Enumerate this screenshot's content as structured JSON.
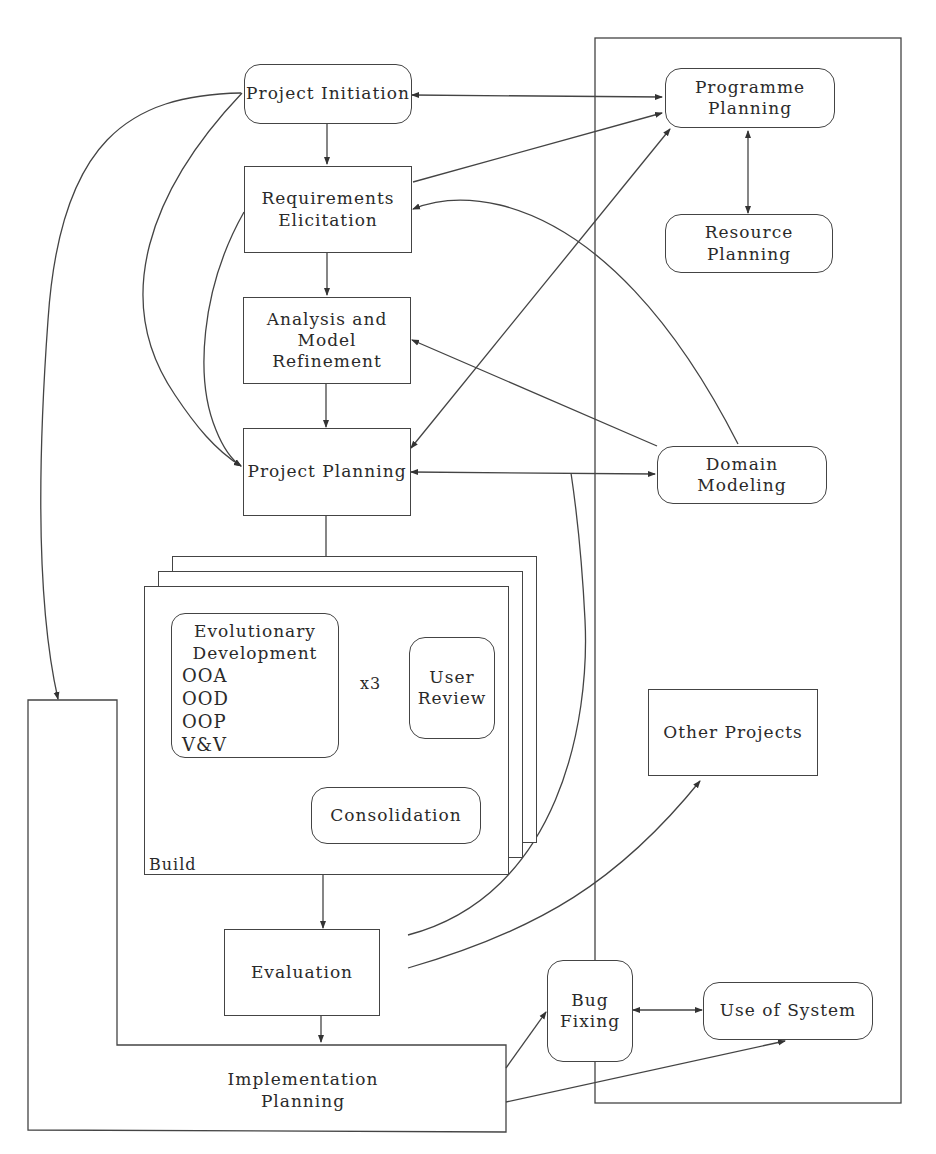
{
  "diagram": {
    "type": "process-flow",
    "nodes": {
      "project_initiation": {
        "line1": "Project Initiation",
        "shape": "rounded"
      },
      "programme_planning": {
        "line1": "Programme",
        "line2": "Planning",
        "shape": "rounded"
      },
      "requirements_elicitation": {
        "line1": "Requirements",
        "line2": "Elicitation",
        "shape": "rect"
      },
      "resource_planning": {
        "line1": "Resource",
        "line2": "Planning",
        "shape": "rounded"
      },
      "analysis_model_refinement": {
        "line1": "Analysis and",
        "line2": "Model Refinement",
        "shape": "rect"
      },
      "project_planning": {
        "line1": "Project Planning",
        "shape": "rect"
      },
      "domain_modeling": {
        "line1": "Domain",
        "line2": "Modeling",
        "shape": "rounded"
      },
      "evolutionary_development": {
        "line1": "Evolutionary",
        "line2": "Development",
        "items": [
          "OOA",
          "OOD",
          "OOP",
          "V&V"
        ],
        "shape": "rounded"
      },
      "iteration_label": "x3",
      "user_review": {
        "line1": "User",
        "line2": "Review",
        "shape": "rounded"
      },
      "consolidation": {
        "line1": "Consolidation",
        "shape": "rounded"
      },
      "build_group": {
        "label": "Build",
        "stack_count": 3
      },
      "other_projects": {
        "line1": "Other Projects",
        "shape": "rect"
      },
      "evaluation": {
        "line1": "Evaluation",
        "shape": "rect"
      },
      "bug_fixing": {
        "line1": "Bug",
        "line2": "Fixing",
        "shape": "rounded"
      },
      "use_of_system": {
        "line1": "Use of System",
        "shape": "rounded"
      },
      "implementation_planning": {
        "line1": "Implementation",
        "line2": "Planning",
        "shape": "L-shaped"
      }
    },
    "edges": [
      {
        "from": "Project Initiation",
        "to": "Programme Planning",
        "bidirectional": true
      },
      {
        "from": "Project Initiation",
        "to": "Requirements Elicitation"
      },
      {
        "from": "Project Initiation",
        "to": "Project Planning",
        "curved": true
      },
      {
        "from": "Project Initiation",
        "to": "Implementation Planning",
        "curved": true
      },
      {
        "from": "Requirements Elicitation",
        "to": "Programme Planning"
      },
      {
        "from": "Requirements Elicitation",
        "to": "Analysis and Model Refinement"
      },
      {
        "from": "Requirements Elicitation",
        "to": "Project Planning",
        "curved": true
      },
      {
        "from": "Programme Planning",
        "to": "Resource Planning",
        "bidirectional": true
      },
      {
        "from": "Programme Planning",
        "to": "Project Planning",
        "bidirectional": true
      },
      {
        "from": "Domain Modeling",
        "to": "Requirements Elicitation",
        "curved": true
      },
      {
        "from": "Domain Modeling",
        "to": "Analysis and Model Refinement"
      },
      {
        "from": "Analysis and Model Refinement",
        "to": "Project Planning"
      },
      {
        "from": "Project Planning",
        "to": "Domain Modeling",
        "bidirectional": true
      },
      {
        "from": "Project Planning",
        "to": "Build"
      },
      {
        "from": "Evolutionary Development",
        "to": "User Review",
        "bidirectional": true,
        "label": "x3"
      },
      {
        "from": "User Review",
        "to": "Consolidation"
      },
      {
        "from": "Build",
        "to": "Evaluation"
      },
      {
        "from": "Evaluation",
        "to": "Project Planning",
        "curved": true
      },
      {
        "from": "Evaluation",
        "to": "Other Projects",
        "curved": true
      },
      {
        "from": "Evaluation",
        "to": "Implementation Planning"
      },
      {
        "from": "Implementation Planning",
        "to": "Bug Fixing"
      },
      {
        "from": "Implementation Planning",
        "to": "Use of System"
      },
      {
        "from": "Bug Fixing",
        "to": "Use of System",
        "bidirectional": true
      }
    ],
    "colors": {
      "stroke": "#444444",
      "text": "#2a2a2a",
      "background": "#ffffff"
    }
  }
}
